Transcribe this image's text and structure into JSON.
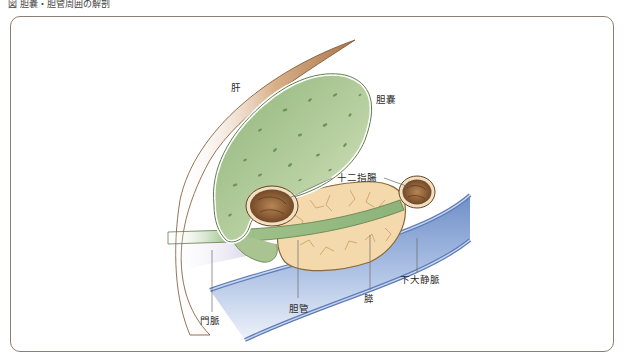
{
  "page": {
    "caption": "図 胆嚢・胆管周囲の解剖"
  },
  "diagram": {
    "type": "anatomical-illustration",
    "colors": {
      "liver": "#b9845a",
      "gallbladder": "#a9c490",
      "gallbladder_outline": "#5f7e4c",
      "duodenum": "#8a5a32",
      "pancreas": "#f1d6a8",
      "ivc": "#8fa9d6",
      "portal_vein": "#c9c6dc",
      "frame": "#8a7f74"
    },
    "labels": {
      "liver": "肝",
      "gallbladder": "胆嚢",
      "duodenum": "十二指腸",
      "pancreas": "膵",
      "ivc": "下大静脈",
      "portal_vein": "門脈",
      "bile_duct": "胆管"
    }
  }
}
